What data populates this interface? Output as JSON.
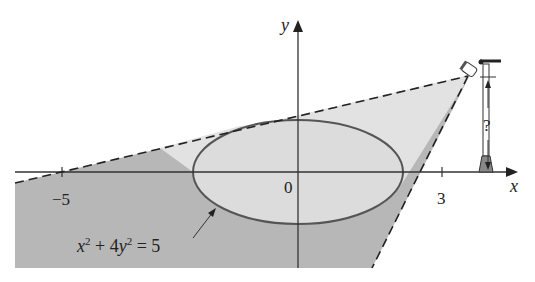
{
  "figure": {
    "axes": {
      "x_label": "x",
      "y_label": "y",
      "origin_label": "0",
      "ticks": [
        {
          "value": -5,
          "label": "−5"
        },
        {
          "value": 3,
          "label": "3"
        }
      ]
    },
    "ellipse": {
      "equation_x": "x",
      "equation_exp1": "2",
      "equation_mid": " + 4",
      "equation_y": "y",
      "equation_exp2": "2",
      "equation_rhs": " = 5"
    },
    "lamp": {
      "height_label": "?"
    },
    "colors": {
      "shadow": "#b4b4b4",
      "light": "#e2e2e2",
      "ellipse_fill": "#dedede",
      "line": "#333333"
    }
  }
}
